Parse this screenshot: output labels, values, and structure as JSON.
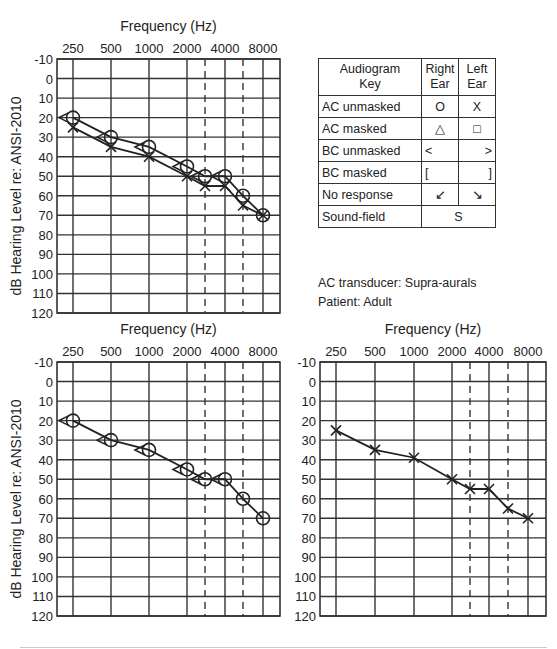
{
  "chart_data": [
    {
      "type": "line",
      "panel": "top-left",
      "title": "Frequency (Hz)",
      "xlabel": "Frequency (Hz)",
      "ylabel": "dB Hearing Level re: ANSI-2010",
      "x_tick_labels": [
        "250",
        "500",
        "1000",
        "2000",
        "4000",
        "8000"
      ],
      "x": [
        250,
        500,
        1000,
        2000,
        3000,
        4000,
        6000,
        8000
      ],
      "y_ticks": [
        -10,
        0,
        10,
        20,
        30,
        40,
        50,
        60,
        70,
        80,
        90,
        100,
        110,
        120
      ],
      "ylim": [
        -10,
        120
      ],
      "y_inverted": true,
      "grid": true,
      "dashed_inter_octave_lines": [
        3000,
        6000
      ],
      "series": [
        {
          "name": "Right Ear AC unmasked",
          "symbol": "O",
          "x": [
            250,
            500,
            1000,
            2000,
            3000,
            4000,
            6000,
            8000
          ],
          "values": [
            20,
            30,
            35,
            45,
            50,
            50,
            60,
            70
          ]
        },
        {
          "name": "Left Ear AC unmasked",
          "symbol": "X",
          "x": [
            250,
            500,
            1000,
            2000,
            3000,
            4000,
            6000,
            8000
          ],
          "values": [
            25,
            35,
            40,
            50,
            55,
            55,
            65,
            70
          ]
        },
        {
          "name": "Right Ear BC unmasked",
          "symbol": "<",
          "x": [
            250,
            500,
            1000,
            2000,
            3000,
            4000
          ],
          "values": [
            20,
            30,
            35,
            45,
            50,
            50
          ]
        }
      ]
    },
    {
      "type": "line",
      "panel": "bottom-left",
      "title": "Frequency (Hz)",
      "xlabel": "Frequency (Hz)",
      "ylabel": "dB Hearing Level re: ANSI-2010",
      "x_tick_labels": [
        "250",
        "500",
        "1000",
        "2000",
        "4000",
        "8000"
      ],
      "y_ticks": [
        -10,
        0,
        10,
        20,
        30,
        40,
        50,
        60,
        70,
        80,
        90,
        100,
        110,
        120
      ],
      "ylim": [
        -10,
        120
      ],
      "y_inverted": true,
      "grid": true,
      "series": [
        {
          "name": "Right Ear AC unmasked",
          "symbol": "O",
          "x": [
            250,
            500,
            1000,
            2000,
            3000,
            4000,
            6000,
            8000
          ],
          "values": [
            20,
            30,
            35,
            45,
            50,
            50,
            60,
            70
          ]
        },
        {
          "name": "Right Ear BC unmasked",
          "symbol": "<",
          "x": [
            250,
            500,
            1000,
            2000,
            3000,
            4000
          ],
          "values": [
            20,
            30,
            35,
            45,
            50,
            50
          ]
        }
      ]
    },
    {
      "type": "line",
      "panel": "bottom-right",
      "title": "Frequency (Hz)",
      "xlabel": "Frequency (Hz)",
      "ylabel": "",
      "x_tick_labels": [
        "250",
        "500",
        "1000",
        "2000",
        "4000",
        "8000"
      ],
      "y_ticks": [
        -10,
        0,
        10,
        20,
        30,
        40,
        50,
        60,
        70,
        80,
        90,
        100,
        110,
        120
      ],
      "ylim": [
        -10,
        120
      ],
      "y_inverted": true,
      "grid": true,
      "series": [
        {
          "name": "Left Ear AC unmasked",
          "symbol": "X",
          "x": [
            250,
            500,
            1000,
            2000,
            3000,
            4000,
            6000,
            8000
          ],
          "values": [
            25,
            35,
            39,
            50,
            55,
            55,
            65,
            70
          ]
        }
      ]
    }
  ],
  "charts": {
    "freq_title": "Frequency (Hz)",
    "ylabel": "dB Hearing Level re: ANSI-2010",
    "x_tick_labels": [
      "250",
      "500",
      "1000",
      "2000",
      "4000",
      "8000"
    ],
    "y_tick_labels": [
      "-10",
      "0",
      "10",
      "20",
      "30",
      "40",
      "50",
      "60",
      "70",
      "80",
      "90",
      "100",
      "110",
      "120"
    ]
  },
  "key": {
    "header": {
      "col1_line1": "Audiogram",
      "col1_line2": "Key",
      "col2_line1": "Right",
      "col2_line2": "Ear",
      "col3_line1": "Left",
      "col3_line2": "Ear"
    },
    "rows": [
      {
        "label": "AC unmasked",
        "right": "O",
        "left": "X"
      },
      {
        "label": "AC masked",
        "right": "△",
        "left": "□"
      },
      {
        "label": "BC unmasked",
        "right": "<",
        "left": ">"
      },
      {
        "label": "BC masked",
        "right": "[",
        "left": "]"
      },
      {
        "label": "No response",
        "right": "↙",
        "left": "↘"
      },
      {
        "label": "Sound-field",
        "both": "S"
      }
    ]
  },
  "notes": {
    "transducer": "AC transducer: Supra-aurals",
    "patient": "Patient: Adult"
  }
}
